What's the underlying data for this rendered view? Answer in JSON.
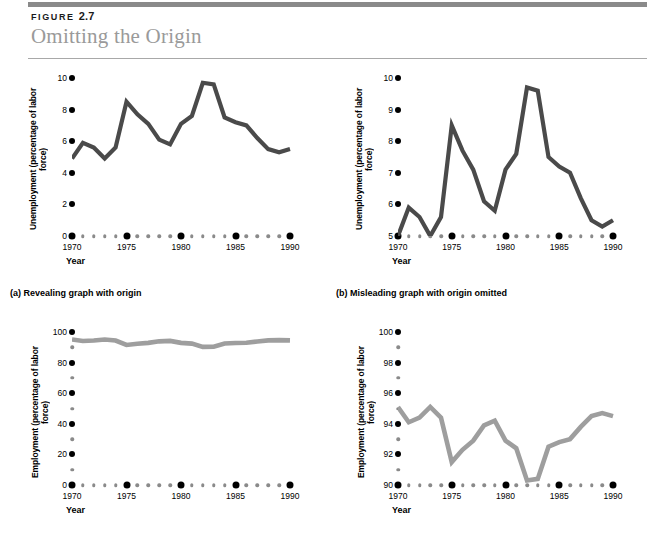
{
  "header": {
    "figure_prefix": "FIGURE",
    "figure_number": "2.7",
    "title": "Omitting the Origin"
  },
  "panels": [
    {
      "id": "a",
      "caption": "(a) Revealing graph with origin",
      "ylabel": "Unemployment (percentage of\nlabor force)",
      "xlabel": "Year"
    },
    {
      "id": "b",
      "caption": "(b) Misleading graph with origin omitted",
      "ylabel": "Unemployment (percentage of\nlabor force)",
      "xlabel": "Year"
    },
    {
      "id": "c",
      "caption": "",
      "ylabel": "Employment (percentage\nof labor force)",
      "xlabel": "Year"
    },
    {
      "id": "d",
      "caption": "",
      "ylabel": "Employment (percentage\nof labor force)",
      "xlabel": "Year"
    }
  ],
  "chart_data": [
    {
      "type": "line",
      "id": "a",
      "title": "(a) Revealing graph with origin",
      "xlabel": "Year",
      "ylabel": "Unemployment (percentage of labor force)",
      "xlim": [
        1970,
        1990
      ],
      "ylim": [
        0,
        10
      ],
      "yticks": [
        0,
        2,
        4,
        6,
        8,
        10
      ],
      "ytick_labels": [
        "0",
        "2",
        "4",
        "6",
        "8",
        "10"
      ],
      "xticks": [
        1970,
        1975,
        1980,
        1985,
        1990
      ],
      "xtick_labels": [
        "1970",
        "1975",
        "1980",
        "1985",
        "1990"
      ],
      "grid": false,
      "legend": "none",
      "line_color": "#4a4a4a",
      "x": [
        1970,
        1971,
        1972,
        1973,
        1974,
        1975,
        1976,
        1977,
        1978,
        1979,
        1980,
        1981,
        1982,
        1983,
        1984,
        1985,
        1986,
        1987,
        1988,
        1989,
        1990
      ],
      "values": [
        4.9,
        5.9,
        5.6,
        4.9,
        5.6,
        8.5,
        7.7,
        7.1,
        6.1,
        5.8,
        7.1,
        7.6,
        9.7,
        9.6,
        7.5,
        7.2,
        7.0,
        6.2,
        5.5,
        5.3,
        5.5
      ]
    },
    {
      "type": "line",
      "id": "b",
      "title": "(b) Misleading graph with origin omitted",
      "xlabel": "Year",
      "ylabel": "Unemployment (percentage of labor force)",
      "xlim": [
        1970,
        1990
      ],
      "ylim": [
        5,
        10
      ],
      "yticks": [
        5,
        6,
        7,
        8,
        9,
        10
      ],
      "ytick_labels": [
        "5",
        "6",
        "7",
        "8",
        "9",
        "10"
      ],
      "xticks": [
        1970,
        1975,
        1980,
        1985,
        1990
      ],
      "xtick_labels": [
        "1970",
        "1975",
        "1980",
        "1985",
        "1990"
      ],
      "grid": false,
      "legend": "none",
      "line_color": "#4a4a4a",
      "x": [
        1970,
        1971,
        1972,
        1973,
        1974,
        1975,
        1976,
        1977,
        1978,
        1979,
        1980,
        1981,
        1982,
        1983,
        1984,
        1985,
        1986,
        1987,
        1988,
        1989,
        1990
      ],
      "values": [
        4.9,
        5.9,
        5.6,
        4.9,
        5.6,
        8.5,
        7.7,
        7.1,
        6.1,
        5.8,
        7.1,
        7.6,
        9.7,
        9.6,
        7.5,
        7.2,
        7.0,
        6.2,
        5.5,
        5.3,
        5.5
      ]
    },
    {
      "type": "line",
      "id": "c",
      "title": "",
      "xlabel": "Year",
      "ylabel": "Employment (percentage of labor force)",
      "xlim": [
        1970,
        1990
      ],
      "ylim": [
        0,
        100
      ],
      "yticks": [
        0,
        20,
        40,
        60,
        80,
        100
      ],
      "ytick_labels": [
        "0",
        "20",
        "40",
        "60",
        "80",
        "100"
      ],
      "yminor": [
        10,
        30,
        50,
        70,
        90
      ],
      "xticks": [
        1970,
        1975,
        1980,
        1985,
        1990
      ],
      "xtick_labels": [
        "1970",
        "1975",
        "1980",
        "1985",
        "1990"
      ],
      "grid": false,
      "legend": "none",
      "line_color": "#9e9e9e",
      "x": [
        1970,
        1971,
        1972,
        1973,
        1974,
        1975,
        1976,
        1977,
        1978,
        1979,
        1980,
        1981,
        1982,
        1983,
        1984,
        1985,
        1986,
        1987,
        1988,
        1989,
        1990
      ],
      "values": [
        95.1,
        94.1,
        94.4,
        95.1,
        94.4,
        91.5,
        92.3,
        92.9,
        93.9,
        94.2,
        92.9,
        92.4,
        90.3,
        90.4,
        92.5,
        92.8,
        93.0,
        93.8,
        94.5,
        94.7,
        94.5
      ]
    },
    {
      "type": "line",
      "id": "d",
      "title": "",
      "xlabel": "Year",
      "ylabel": "Employment (percentage of labor force)",
      "xlim": [
        1970,
        1990
      ],
      "ylim": [
        90,
        100
      ],
      "yticks": [
        90,
        92,
        94,
        96,
        98,
        100
      ],
      "ytick_labels": [
        "90",
        "92",
        "94",
        "96",
        "98",
        "100"
      ],
      "yminor": [
        91,
        93,
        95,
        97,
        99
      ],
      "xticks": [
        1970,
        1975,
        1980,
        1985,
        1990
      ],
      "xtick_labels": [
        "1970",
        "1975",
        "1980",
        "1985",
        "1990"
      ],
      "grid": false,
      "legend": "none",
      "line_color": "#9e9e9e",
      "x": [
        1970,
        1971,
        1972,
        1973,
        1974,
        1975,
        1976,
        1977,
        1978,
        1979,
        1980,
        1981,
        1982,
        1983,
        1984,
        1985,
        1986,
        1987,
        1988,
        1989,
        1990
      ],
      "values": [
        95.1,
        94.1,
        94.4,
        95.1,
        94.4,
        91.5,
        92.3,
        92.9,
        93.9,
        94.2,
        92.9,
        92.4,
        90.3,
        90.4,
        92.5,
        92.8,
        93.0,
        93.8,
        94.5,
        94.7,
        94.5
      ]
    }
  ]
}
